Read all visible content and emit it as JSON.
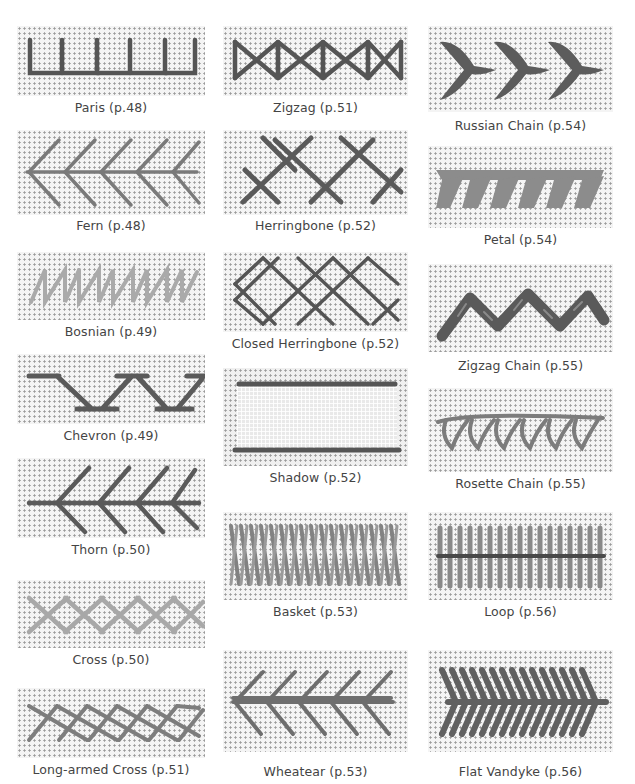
{
  "colors": {
    "dark_thread": "#575757",
    "mid_thread": "#7a7a7a",
    "light_thread": "#a9a9a9",
    "canvas": "#f4f4f4",
    "caption_text": "#444444"
  },
  "columns": [
    {
      "stitches": [
        {
          "name": "Paris",
          "page": "p.48",
          "label": "Paris (p.48)",
          "thread": "dark"
        },
        {
          "name": "Fern",
          "page": "p.48",
          "label": "Fern (p.48)",
          "thread": "mid"
        },
        {
          "name": "Bosnian",
          "page": "p.49",
          "label": "Bosnian (p.49)",
          "thread": "light"
        },
        {
          "name": "Chevron",
          "page": "p.49",
          "label": "Chevron (p.49)",
          "thread": "dark"
        },
        {
          "name": "Thorn",
          "page": "p.50",
          "label": "Thorn (p.50)",
          "thread": "dark"
        },
        {
          "name": "Cross",
          "page": "p.50",
          "label": "Cross (p.50)",
          "thread": "light"
        },
        {
          "name": "Long-armed Cross",
          "page": "p.51",
          "label": "Long-armed Cross (p.51)",
          "thread": "mid"
        }
      ]
    },
    {
      "stitches": [
        {
          "name": "Zigzag",
          "page": "p.51",
          "label": "Zigzag (p.51)",
          "thread": "dark"
        },
        {
          "name": "Herringbone",
          "page": "p.52",
          "label": "Herringbone (p.52)",
          "thread": "dark"
        },
        {
          "name": "Closed Herringbone",
          "page": "p.52",
          "label": "Closed Herringbone (p.52)",
          "thread": "dark"
        },
        {
          "name": "Shadow",
          "page": "p.52",
          "label": "Shadow (p.52)",
          "thread": "dark"
        },
        {
          "name": "Basket",
          "page": "p.53",
          "label": "Basket (p.53)",
          "thread": "mid"
        },
        {
          "name": "Wheatear",
          "page": "p.53",
          "label": "Wheatear (p.53)",
          "thread": "mid"
        }
      ]
    },
    {
      "stitches": [
        {
          "name": "Russian Chain",
          "page": "p.54",
          "label": "Russian Chain (p.54)",
          "thread": "dark"
        },
        {
          "name": "Petal",
          "page": "p.54",
          "label": "Petal (p.54)",
          "thread": "mid"
        },
        {
          "name": "Zigzag Chain",
          "page": "p.55",
          "label": "Zigzag Chain (p.55)",
          "thread": "dark"
        },
        {
          "name": "Rosette Chain",
          "page": "p.55",
          "label": "Rosette Chain (p.55)",
          "thread": "mid"
        },
        {
          "name": "Loop",
          "page": "p.56",
          "label": "Loop (p.56)",
          "thread": "mid"
        },
        {
          "name": "Flat Vandyke",
          "page": "p.56",
          "label": "Flat Vandyke (p.56)",
          "thread": "dark"
        }
      ]
    }
  ]
}
